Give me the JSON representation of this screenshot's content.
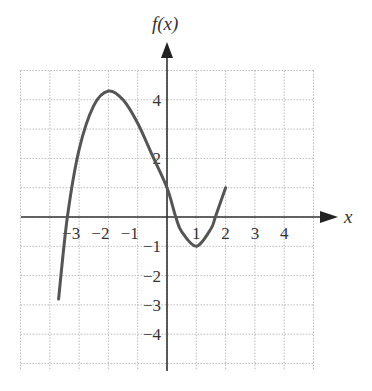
{
  "chart_data": {
    "type": "line",
    "title": "",
    "xlabel": "x",
    "ylabel": "f(x)",
    "xlim": [
      -5,
      5
    ],
    "ylim": [
      -5,
      5
    ],
    "grid": true,
    "x_ticks": [
      -3,
      -2,
      -1,
      1,
      2,
      3,
      4
    ],
    "y_ticks": [
      4,
      2,
      -1,
      -2,
      -3,
      -4
    ],
    "x_tick_labels": [
      "−3",
      "−2",
      "−1",
      "1",
      "2",
      "3",
      "4"
    ],
    "y_tick_labels": [
      "4",
      "2",
      "−1",
      "−2",
      "−3",
      "−4"
    ],
    "series": [
      {
        "name": "f(x)",
        "x": [
          -3.7,
          -3.4,
          -3.0,
          -2.5,
          -2.0,
          -1.5,
          -1.0,
          -0.5,
          0.0,
          0.3,
          0.5,
          1.0,
          1.5,
          1.65,
          2.0
        ],
        "y": [
          -2.8,
          0.0,
          2.3,
          3.8,
          4.3,
          4.0,
          3.2,
          2.1,
          1.0,
          0.0,
          -0.5,
          -1.0,
          -0.4,
          0.0,
          1.0
        ]
      }
    ],
    "key_points": {
      "local_max": [
        -2,
        4.3
      ],
      "local_min": [
        1,
        -1
      ],
      "y_intercept": [
        0,
        1
      ],
      "start": [
        -3.7,
        -2.8
      ],
      "end": [
        2,
        1
      ]
    }
  },
  "labels": {
    "x_axis": "x",
    "y_axis": "f(x)"
  }
}
